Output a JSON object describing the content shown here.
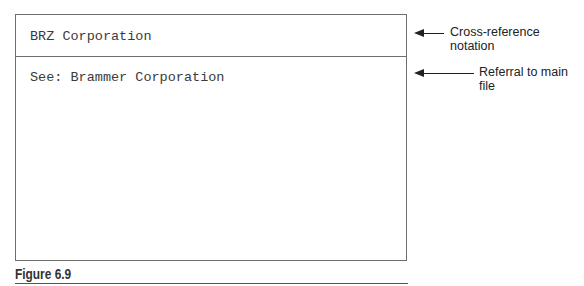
{
  "card": {
    "header_text": "BRZ Corporation",
    "body_text": "See: Brammer Corporation"
  },
  "annotations": [
    {
      "label": "Cross-reference notation"
    },
    {
      "label": "Referral to main file"
    }
  ],
  "figure": {
    "caption": "Figure 6.9"
  }
}
